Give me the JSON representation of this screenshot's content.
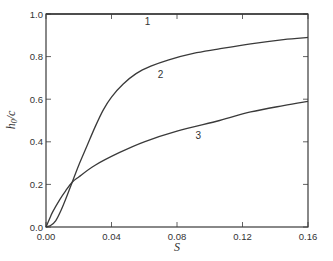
{
  "chart_data": {
    "type": "line",
    "title": "",
    "xlabel": "S",
    "ylabel": "h0/c",
    "xlim": [
      0.0,
      0.16
    ],
    "ylim": [
      0.0,
      1.0
    ],
    "grid": false,
    "legend": "none (curves labeled inline 1, 2, 3)",
    "x_ticks": [
      "0.00",
      "0.04",
      "0.08",
      "0.12",
      "0.16"
    ],
    "y_ticks": [
      "0.0",
      "0.2",
      "0.4",
      "0.6",
      "0.8",
      "1.0"
    ],
    "series": [
      {
        "name": "1",
        "label_pos": [
          0.062,
          0.965
        ],
        "x": [
          0.0,
          0.16
        ],
        "y": [
          1.0,
          1.0
        ]
      },
      {
        "name": "2",
        "label_pos": [
          0.07,
          0.72
        ],
        "x": [
          0.0,
          0.003,
          0.006,
          0.009,
          0.012,
          0.016,
          0.02,
          0.025,
          0.03,
          0.035,
          0.04,
          0.047,
          0.055,
          0.064,
          0.075,
          0.09,
          0.105,
          0.125,
          0.145,
          0.16
        ],
        "y": [
          0.0,
          0.008,
          0.03,
          0.075,
          0.13,
          0.21,
          0.29,
          0.38,
          0.47,
          0.55,
          0.61,
          0.67,
          0.72,
          0.755,
          0.785,
          0.815,
          0.835,
          0.86,
          0.88,
          0.89
        ]
      },
      {
        "name": "3",
        "label_pos": [
          0.093,
          0.43
        ],
        "x": [
          0.0,
          0.002,
          0.004,
          0.0085,
          0.012,
          0.016,
          0.02,
          0.03,
          0.045,
          0.06,
          0.08,
          0.106,
          0.125,
          0.145,
          0.16
        ],
        "y": [
          0.0,
          0.035,
          0.07,
          0.13,
          0.17,
          0.21,
          0.235,
          0.29,
          0.35,
          0.4,
          0.45,
          0.5,
          0.54,
          0.57,
          0.59
        ]
      }
    ]
  }
}
